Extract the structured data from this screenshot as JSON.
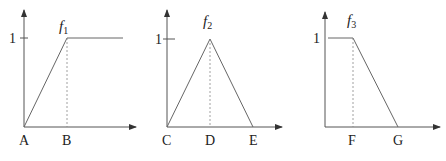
{
  "panels": [
    {
      "name": "f1",
      "function_label": "f",
      "function_subscript": "1",
      "y_tick_label": "1",
      "x_labels": [
        "A",
        "B"
      ],
      "shape": "ramp-up-then-flat"
    },
    {
      "name": "f2",
      "function_label": "f",
      "function_subscript": "2",
      "y_tick_label": "1",
      "x_labels": [
        "C",
        "D",
        "E"
      ],
      "shape": "triangle"
    },
    {
      "name": "f3",
      "function_label": "f",
      "function_subscript": "3",
      "y_tick_label": "1",
      "x_labels": [
        "F",
        "G"
      ],
      "shape": "flat-then-ramp-down"
    }
  ],
  "colors": {
    "line": "#555555",
    "text": "#222222"
  }
}
